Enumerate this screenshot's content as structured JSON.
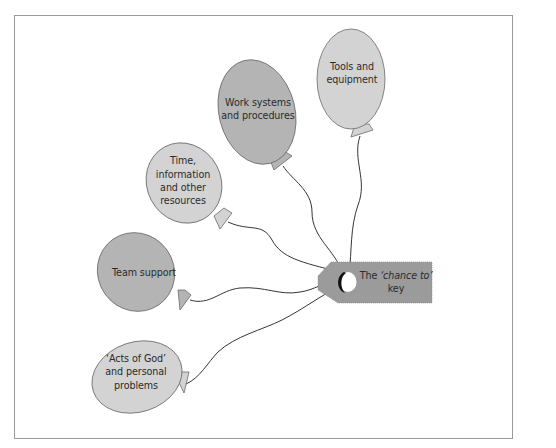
{
  "figure": {
    "frame_border_color": "#9a9a9a",
    "background_color": "#ffffff",
    "balloon_colors": {
      "light": "#d3d3d3",
      "dark": "#b4b4b4",
      "outline": "#6a6a6a"
    },
    "string_color": "#1e1e1e",
    "key": {
      "label_line1_prefix": "The ",
      "label_line1_italic": "‘chance to’",
      "label_line2": "key",
      "color": "#9b9b9b"
    },
    "balloons": [
      {
        "id": "tools",
        "lines": [
          "Tools and",
          "equipment"
        ],
        "shade": "light"
      },
      {
        "id": "work-systems",
        "lines": [
          "Work systems",
          "and procedures"
        ],
        "shade": "dark"
      },
      {
        "id": "time",
        "lines": [
          "Time,",
          "information",
          "and other",
          "resources"
        ],
        "shade": "light"
      },
      {
        "id": "team-support",
        "lines": [
          "Team support"
        ],
        "shade": "dark"
      },
      {
        "id": "acts-of-god",
        "lines": [
          "‘Acts of God’",
          "and personal",
          "problems"
        ],
        "shade": "light"
      }
    ]
  }
}
